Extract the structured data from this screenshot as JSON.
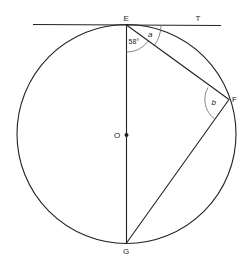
{
  "diagram": {
    "points": {
      "E": {
        "label": "E"
      },
      "T": {
        "label": "T"
      },
      "F": {
        "label": "F"
      },
      "G": {
        "label": "G"
      },
      "O": {
        "label": "O"
      }
    },
    "angles": {
      "TEF": {
        "label": "a"
      },
      "FEG": {
        "label": "58°"
      },
      "EFG": {
        "label": "b"
      }
    },
    "colors": {
      "stroke": "#222222",
      "arc": "#555555",
      "background": "#ffffff"
    }
  }
}
